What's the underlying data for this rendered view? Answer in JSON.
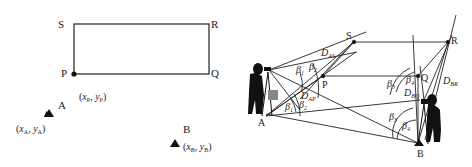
{
  "left_diagram": {
    "points": {
      "S": "S",
      "R": "R",
      "P": "P",
      "Q": "Q",
      "A": "A",
      "B": "B"
    },
    "coords": {
      "P": {
        "x": "x",
        "xsub": "P",
        "y": "y",
        "ysub": "P"
      },
      "A": {
        "x": "x",
        "xsub": "A",
        "y": "y",
        "ysub": "A"
      },
      "B": {
        "x": "x",
        "xsub": "B",
        "y": "y",
        "ysub": "B"
      }
    }
  },
  "right_diagram": {
    "points": {
      "S": "S",
      "R": "R",
      "P": "P",
      "Q": "Q",
      "A": "A",
      "B": "B"
    },
    "angles": {
      "b1": "β",
      "b1sub": "1",
      "b2": "β",
      "b2sub": "2",
      "b3": "β",
      "b3sub": "3",
      "b4": "β",
      "b4sub": "4"
    },
    "distances": {
      "DAS": "D",
      "DASsub": "AS",
      "DAP": "D",
      "DAPsub": "AP",
      "DBQ": "D",
      "DBQsub": "BQ",
      "DBR": "D",
      "DBRsub": "BR"
    }
  }
}
